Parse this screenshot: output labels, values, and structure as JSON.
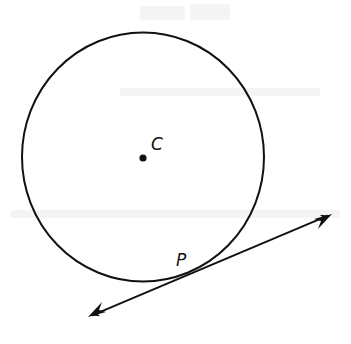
{
  "diagram": {
    "type": "circle-with-tangent-line",
    "circle": {
      "cx": 143,
      "cy": 157,
      "rx": 121,
      "ry": 124.5,
      "stroke": "#111111",
      "stroke_width": 2
    },
    "center_point": {
      "label": "C",
      "x": 143,
      "y": 158,
      "label_x": 152,
      "label_y": 150
    },
    "tangent_point": {
      "label": "P",
      "x": 205,
      "y": 267,
      "label_x": 177,
      "label_y": 266
    },
    "tangent_line": {
      "x1": 88,
      "y1": 317,
      "x2": 332,
      "y2": 214,
      "arrows": "both"
    },
    "colors": {
      "ink": "#111111",
      "background": "#ffffff"
    }
  }
}
